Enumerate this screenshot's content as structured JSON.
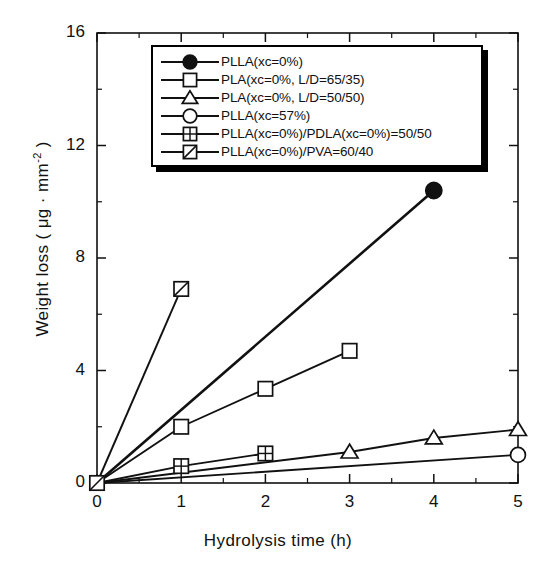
{
  "chart_data": {
    "type": "line",
    "title": "",
    "xlabel": "Hydrolysis time (h)",
    "ylabel_text": "Weight loss ( μg · mm",
    "ylabel_sup": "-2",
    "ylabel_tail": " )",
    "xlim": [
      0,
      5
    ],
    "ylim": [
      0,
      16
    ],
    "xticks": [
      0,
      1,
      2,
      3,
      4,
      5
    ],
    "yticks": [
      0,
      4,
      8,
      12,
      16
    ],
    "xtick_labels": [
      "0",
      "1",
      "2",
      "3",
      "4",
      "5"
    ],
    "ytick_labels": [
      "0",
      "4",
      "8",
      "12",
      "16"
    ],
    "x_minor_ticks": [
      0.5,
      1.5,
      2.5,
      3.5,
      4.5
    ],
    "y_minor_ticks": [
      2,
      6,
      10,
      14
    ],
    "grid": false,
    "legend_position": "top-center",
    "series": [
      {
        "name": "PLLA(xc=0%)",
        "marker": "filled-circle",
        "x": [
          0,
          4
        ],
        "y": [
          0,
          10.4
        ]
      },
      {
        "name": "PLA(xc=0%, L/D=65/35)",
        "marker": "open-square",
        "x": [
          0,
          1,
          2,
          3
        ],
        "y": [
          0,
          2.0,
          3.35,
          4.7
        ]
      },
      {
        "name": "PLA(xc=0%, L/D=50/50)",
        "marker": "open-triangle",
        "x": [
          0,
          3,
          4,
          5
        ],
        "y": [
          0,
          1.1,
          1.6,
          1.9
        ]
      },
      {
        "name": "PLLA(xc=57%)",
        "marker": "open-circle",
        "x": [
          0,
          5
        ],
        "y": [
          0,
          1.0
        ]
      },
      {
        "name": "PLLA(xc=0%)/PDLA(xc=0%)=50/50",
        "marker": "crossed-square",
        "x": [
          0,
          1,
          2
        ],
        "y": [
          0,
          0.6,
          1.05
        ]
      },
      {
        "name": "PLLA(xc=0%)/PVA=60/40",
        "marker": "diagonal-square",
        "x": [
          0,
          1
        ],
        "y": [
          0,
          6.9
        ]
      }
    ]
  },
  "legend": {
    "items": [
      {
        "label": "PLLA(xc=0%)",
        "marker": "filled-circle"
      },
      {
        "label": "PLA(xc=0%, L/D=65/35)",
        "marker": "open-square"
      },
      {
        "label": "PLA(xc=0%, L/D=50/50)",
        "marker": "open-triangle"
      },
      {
        "label": "PLLA(xc=57%)",
        "marker": "open-circle"
      },
      {
        "label": "PLLA(xc=0%)/PDLA(xc=0%)=50/50",
        "marker": "crossed-square"
      },
      {
        "label": "PLLA(xc=0%)/PVA=60/40",
        "marker": "diagonal-square"
      }
    ]
  },
  "axes": {
    "x_title": "Hydrolysis time (h)",
    "y_title_prefix": "Weight loss ( μg · mm",
    "y_title_sup": "-2",
    "y_title_suffix": " )"
  },
  "colors": {
    "ink": "#111111",
    "background": "#ffffff",
    "marker_fill": "#ffffff",
    "marker_stroke": "#111111"
  }
}
